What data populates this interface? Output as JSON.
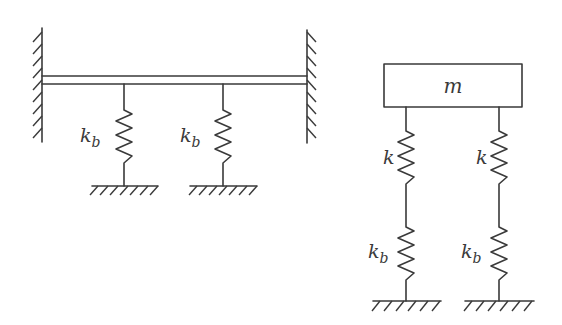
{
  "diagram": {
    "type": "mechanical-spring-system",
    "left_system": {
      "description": "Beam clamped between two walls, supported by two springs to ground",
      "springs": [
        {
          "label": "k",
          "subscript": "b"
        },
        {
          "label": "k",
          "subscript": "b"
        }
      ]
    },
    "right_system": {
      "mass": {
        "label": "m"
      },
      "columns": [
        {
          "upper_spring": {
            "label": "k"
          },
          "lower_spring": {
            "label": "k",
            "subscript": "b"
          }
        },
        {
          "upper_spring": {
            "label": "k"
          },
          "lower_spring": {
            "label": "k",
            "subscript": "b"
          }
        }
      ]
    },
    "colors": {
      "stroke": "#3a3a3a",
      "background": "#ffffff"
    }
  }
}
